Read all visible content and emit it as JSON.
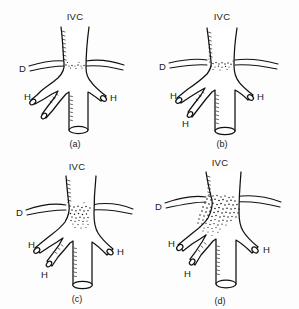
{
  "figure": {
    "title": "",
    "background_color": "#ffffff",
    "ink_color": "#111111",
    "panel_count": 4,
    "grid": "2x2"
  },
  "labels": {
    "ivc": "IVC",
    "duodenum": "D",
    "hepatic": "H",
    "caption_a": "(a)",
    "caption_b": "(b)",
    "caption_c": "(c)",
    "caption_d": "(d)"
  },
  "panels": [
    {
      "id": "a",
      "caption": "(a)",
      "ivc_label": "IVC",
      "duodenum_label": "D",
      "hepatic_labels": [
        "H",
        "H"
      ],
      "hepatic_count": 3,
      "stipple_extent": "minimal",
      "stipple_description": "light stippling confined to the confluence just above the renal level"
    },
    {
      "id": "b",
      "caption": "(b)",
      "ivc_label": "IVC",
      "duodenum_label": "D",
      "hepatic_labels": [
        "H",
        "H"
      ],
      "hepatic_count": 3,
      "stipple_extent": "mild",
      "stipple_description": "stippled band across the confluence extending into the left limb"
    },
    {
      "id": "c",
      "caption": "(c)",
      "ivc_label": "IVC",
      "duodenum_label": "D",
      "hepatic_labels": [
        "H",
        "H"
      ],
      "hepatic_count": 3,
      "stipple_extent": "moderate",
      "stipple_description": "dense stippled mass filling the confluence and upper cava"
    },
    {
      "id": "d",
      "caption": "(d)",
      "ivc_label": "IVC",
      "duodenum_label": "D",
      "hepatic_labels": [
        "H",
        "H"
      ],
      "hepatic_count": 3,
      "stipple_extent": "extensive",
      "stipple_description": "large dense stippled mass spanning the confluence and all branch origins"
    }
  ]
}
